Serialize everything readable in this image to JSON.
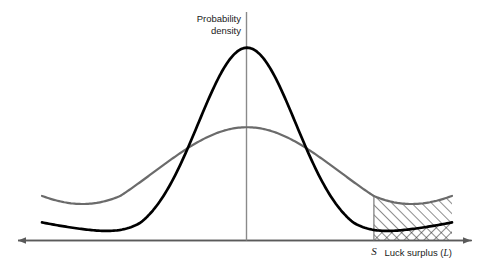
{
  "chart_data": {
    "type": "line",
    "title": "",
    "xlabel": "Luck surplus (L)",
    "xlabel_plain": "Luck surplus",
    "xlabel_variable": "L",
    "ylabel": "Probability density",
    "ylabel_line1": "Probability",
    "ylabel_line2": "density",
    "grid": false,
    "legend": "none",
    "xlim": [
      -4.2,
      4.2
    ],
    "ylim": [
      0,
      1.0
    ],
    "axis_origin_x": 0,
    "annotations": [
      {
        "name": "threshold-tick",
        "label": "S",
        "x": 2.6,
        "description": "Luck surplus threshold on horizontal axis"
      },
      {
        "name": "upper-hatched-region",
        "pattern": "diagonal-hatch",
        "description": "Area between the low-variance (gray) curve and the high-variance (black) curve to the right of S"
      },
      {
        "name": "lower-crosshatched-region",
        "pattern": "cross-hatch",
        "description": "Area under the high-variance (black) curve to the right of S"
      }
    ],
    "series": [
      {
        "name": "narrow-distribution",
        "color": "#000000",
        "linewidth": 2.6,
        "description": "Tall narrow normal density (low variance)",
        "mean": 0,
        "sigma": 1.0,
        "peak_y": 0.8,
        "tail_y_at_right_edge": 0.075,
        "x": [
          -4.2,
          -3.8,
          -3.4,
          -3.0,
          -2.6,
          -2.2,
          -1.8,
          -1.4,
          -1.0,
          -0.6,
          -0.2,
          0.0,
          0.2,
          0.6,
          1.0,
          1.4,
          1.8,
          2.2,
          2.6,
          3.0,
          3.4,
          3.8,
          4.2
        ],
        "y": [
          0.046,
          0.052,
          0.06,
          0.072,
          0.092,
          0.13,
          0.21,
          0.35,
          0.53,
          0.7,
          0.79,
          0.8,
          0.79,
          0.7,
          0.53,
          0.35,
          0.21,
          0.13,
          0.092,
          0.072,
          0.06,
          0.052,
          0.046
        ]
      },
      {
        "name": "wide-distribution",
        "color": "#6b6b6b",
        "linewidth": 2.2,
        "description": "Lower flatter normal density (high variance)",
        "mean": 0,
        "sigma": 1.9,
        "peak_y": 0.47,
        "tail_y_at_right_edge": 0.185,
        "x": [
          -4.2,
          -3.8,
          -3.4,
          -3.0,
          -2.6,
          -2.2,
          -1.8,
          -1.4,
          -1.0,
          -0.6,
          -0.2,
          0.0,
          0.2,
          0.6,
          1.0,
          1.4,
          1.8,
          2.2,
          2.6,
          3.0,
          3.4,
          3.8,
          4.2
        ],
        "y": [
          0.175,
          0.19,
          0.212,
          0.24,
          0.275,
          0.312,
          0.35,
          0.39,
          0.424,
          0.45,
          0.468,
          0.47,
          0.468,
          0.45,
          0.424,
          0.39,
          0.35,
          0.312,
          0.275,
          0.24,
          0.212,
          0.19,
          0.175
        ]
      }
    ],
    "crossings": [
      {
        "x": -1.32,
        "y": 0.375
      },
      {
        "x": 1.32,
        "y": 0.375
      }
    ],
    "colors": {
      "axis": "#5a5a5a",
      "narrow_curve": "#000000",
      "wide_curve": "#6b6b6b",
      "hatch": "#333333",
      "background": "#ffffff",
      "text": "#1a1a1a"
    }
  }
}
